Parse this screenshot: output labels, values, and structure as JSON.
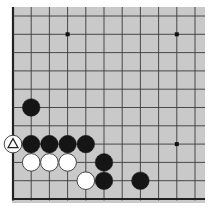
{
  "board": {
    "description": "Partial Go board, lower-left corner view",
    "background": "#c9c9c9",
    "line_color": "#3a3a3a",
    "edge_color": "#222222",
    "origin_x": 13,
    "origin_y": 16,
    "spacing_x": 18.2,
    "spacing_y": 18.3,
    "cols": 11,
    "rows": 11,
    "left_edge": true,
    "bottom_edge": true,
    "top_edge": false,
    "right_edge": false,
    "star_points": [
      [
        3,
        1
      ],
      [
        9,
        1
      ],
      [
        9,
        7
      ]
    ],
    "stones": [
      {
        "color": "black",
        "col": 1,
        "row": 5
      },
      {
        "color": "white",
        "col": 0,
        "row": 7,
        "marker": "triangle"
      },
      {
        "color": "black",
        "col": 1,
        "row": 7
      },
      {
        "color": "black",
        "col": 2,
        "row": 7
      },
      {
        "color": "black",
        "col": 3,
        "row": 7
      },
      {
        "color": "black",
        "col": 4,
        "row": 7
      },
      {
        "color": "white",
        "col": 1,
        "row": 8
      },
      {
        "color": "white",
        "col": 2,
        "row": 8
      },
      {
        "color": "white",
        "col": 3,
        "row": 8
      },
      {
        "color": "black",
        "col": 5,
        "row": 8
      },
      {
        "color": "white",
        "col": 4,
        "row": 9
      },
      {
        "color": "black",
        "col": 5,
        "row": 9
      },
      {
        "color": "black",
        "col": 7,
        "row": 9
      }
    ]
  }
}
